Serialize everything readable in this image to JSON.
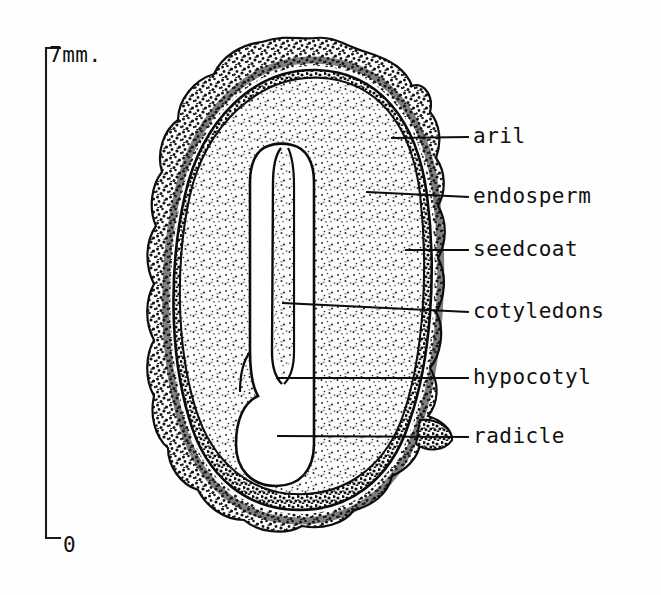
{
  "figure": {
    "background_color": "#fefefe",
    "ink_color": "#111111"
  },
  "scale_bar": {
    "name": "vertical-scale-bar",
    "top_label": "7mm.",
    "bottom_label": "0",
    "units": "mm",
    "max_value": 7,
    "min_value": 0,
    "orientation": "vertical",
    "x": 46,
    "y_top": 48,
    "y_bottom": 538,
    "tick_length": 14
  },
  "labels": [
    {
      "id": "aril",
      "text": "aril",
      "text_x": 473,
      "text_y": 137,
      "leader_from_x": 392,
      "leader_from_y": 138,
      "leader_to_x": 468,
      "leader_to_y": 137
    },
    {
      "id": "endosperm",
      "text": "endosperm",
      "text_x": 473,
      "text_y": 197,
      "leader_from_x": 367,
      "leader_from_y": 192,
      "leader_to_x": 468,
      "leader_to_y": 197
    },
    {
      "id": "seedcoat",
      "text": "seedcoat",
      "text_x": 473,
      "text_y": 250,
      "leader_from_x": 406,
      "leader_from_y": 250,
      "leader_to_x": 468,
      "leader_to_y": 250
    },
    {
      "id": "cotyledons",
      "text": "cotyledons",
      "text_x": 473,
      "text_y": 312,
      "leader_from_x": 283,
      "leader_from_y": 303,
      "leader_to_x": 468,
      "leader_to_y": 312
    },
    {
      "id": "hypocotyl",
      "text": "hypocotyl",
      "text_x": 473,
      "text_y": 378,
      "leader_from_x": 277,
      "leader_from_y": 378,
      "leader_to_x": 468,
      "leader_to_y": 378
    },
    {
      "id": "radicle",
      "text": "radicle",
      "text_x": 473,
      "text_y": 437,
      "leader_from_x": 278,
      "leader_from_y": 436,
      "leader_to_x": 468,
      "leader_to_y": 437
    }
  ],
  "structures": [
    {
      "id": "aril",
      "label": "aril",
      "description": "bumpy stippled outer fleshy covering"
    },
    {
      "id": "seedcoat",
      "label": "seedcoat",
      "description": "thin dark band inside the aril"
    },
    {
      "id": "endosperm",
      "label": "endosperm",
      "description": "large stippled nutritive tissue filling the seed"
    },
    {
      "id": "cotyledons",
      "label": "cotyledons",
      "description": "two narrow elongate white blades in the embryo"
    },
    {
      "id": "hypocotyl",
      "label": "hypocotyl",
      "description": "widened white embryo axis below the cotyledons"
    },
    {
      "id": "radicle",
      "label": "radicle",
      "description": "rounded lower tip of the embryo axis"
    }
  ]
}
